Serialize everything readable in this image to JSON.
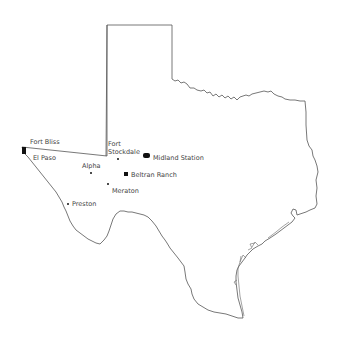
{
  "map": {
    "region": "Texas",
    "outline_color": "#555555",
    "marker_color": "#111111",
    "label_color": "#444444"
  },
  "locations": [
    {
      "name": "Fort Bliss",
      "x": 30,
      "y": 141,
      "marker": {
        "x": 22,
        "y": 147,
        "w": 4,
        "h": 7
      }
    },
    {
      "name": "El Paso",
      "x": 33,
      "y": 155,
      "marker": null
    },
    {
      "name": "Alpha",
      "x": 82,
      "y": 163,
      "marker": {
        "x": 90,
        "y": 172,
        "w": 2,
        "h": 2
      }
    },
    {
      "name": "Fort",
      "x": 108,
      "y": 141,
      "marker": null
    },
    {
      "name": "Stockdale",
      "x": 108,
      "y": 149,
      "marker": {
        "x": 117,
        "y": 158,
        "w": 2,
        "h": 2
      }
    },
    {
      "name": "Midland Station",
      "x": 153,
      "y": 155,
      "marker": {
        "x": 143,
        "y": 153,
        "w": 7,
        "h": 5
      }
    },
    {
      "name": "Beltran Ranch",
      "x": 131,
      "y": 171,
      "marker": {
        "x": 124,
        "y": 172,
        "w": 4,
        "h": 4
      }
    },
    {
      "name": "Meraton",
      "x": 112,
      "y": 187,
      "marker": {
        "x": 107,
        "y": 183,
        "w": 2,
        "h": 2
      }
    },
    {
      "name": "Preston",
      "x": 72,
      "y": 201,
      "marker": {
        "x": 67,
        "y": 203,
        "w": 2,
        "h": 2
      }
    }
  ]
}
